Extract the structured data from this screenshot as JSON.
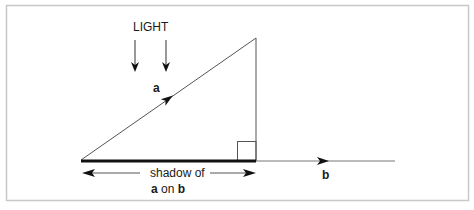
{
  "diagram": {
    "light_label": "LIGHT",
    "vector_a_label": "a",
    "vector_b_label": "b",
    "shadow_label_line1": "shadow of",
    "shadow_label_line2_a": "a",
    "shadow_label_line2_on": " on ",
    "shadow_label_line2_b": "b",
    "colors": {
      "frame": "#c8c8c8",
      "line": "#555555",
      "shadow": "#111111",
      "text": "#1a1a1a"
    }
  }
}
